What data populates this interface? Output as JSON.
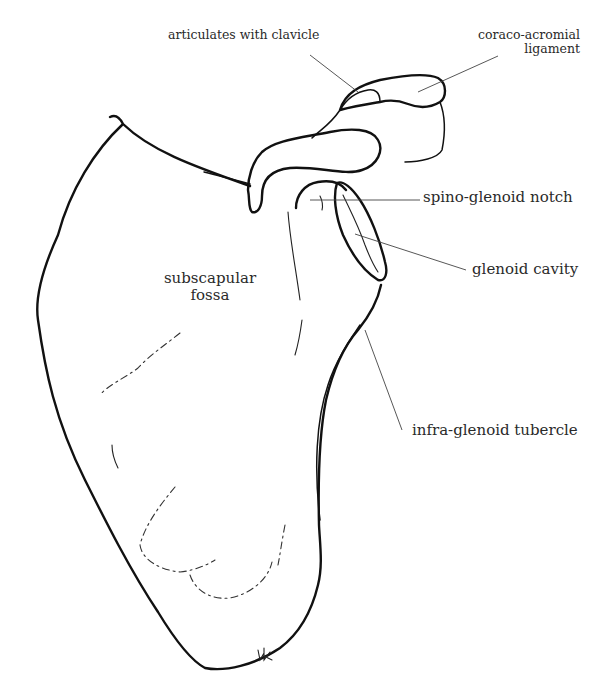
{
  "diagram": {
    "colors": {
      "background": "#ffffff",
      "line": "#111111",
      "text": "#2a2a2a"
    },
    "labels": [
      {
        "id": "articulates-with-clavicle",
        "text": "articulates with clavicle"
      },
      {
        "id": "coraco-acromial-ligament",
        "line1": "coraco-acromial",
        "line2": "ligament"
      },
      {
        "id": "spino-glenoid-notch",
        "text": "spino-glenoid notch"
      },
      {
        "id": "glenoid-cavity",
        "text": "glenoid cavity"
      },
      {
        "id": "subscapular-fossa",
        "line1": "subscapular",
        "line2": "fossa"
      },
      {
        "id": "infra-glenoid-tubercle",
        "text": "infra-glenoid tubercle"
      }
    ],
    "signature": "JK"
  }
}
